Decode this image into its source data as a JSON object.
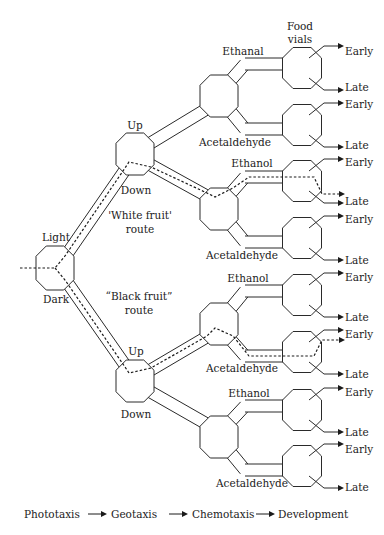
{
  "diagram": {
    "colors": {
      "stroke": "#2a2a2a",
      "text": "#222222",
      "background": "#ffffff"
    },
    "phototaxis": {
      "chamber_center": [
        55,
        268
      ],
      "labels": {
        "light": "Light",
        "dark": "Dark"
      }
    },
    "routes": {
      "white": {
        "line1": "'White fruit'",
        "line2": "route"
      },
      "black": {
        "line1": "“Black fruit”",
        "line2": "route"
      }
    },
    "geotaxis": [
      {
        "id": "geo-upper",
        "center": [
          135,
          154
        ],
        "up": "Up",
        "down": "Down"
      },
      {
        "id": "geo-lower",
        "center": [
          135,
          381
        ],
        "up": "Up",
        "down": "Down"
      }
    ],
    "chemotaxis": [
      {
        "id": "chem-1",
        "center": [
          219,
          96
        ],
        "top_label": "Ethanal",
        "bottom_label": "Acetaldehyde"
      },
      {
        "id": "chem-2",
        "center": [
          219,
          209
        ],
        "top_label": "Ethanol",
        "bottom_label": "Acetaldehyde"
      },
      {
        "id": "chem-3",
        "center": [
          219,
          324
        ],
        "top_label": "Ethanol",
        "bottom_label": "Acetaldehyde"
      },
      {
        "id": "chem-4",
        "center": [
          219,
          437
        ],
        "top_label": "Ethanol",
        "bottom_label": "Acetaldehyde"
      }
    ],
    "food_vials_header": {
      "line1": "Food",
      "line2": "vials"
    },
    "vials": [
      {
        "center": [
          302,
          68
        ],
        "early": "Early",
        "late": "Late"
      },
      {
        "center": [
          302,
          125
        ],
        "early": "Early",
        "late": "Late"
      },
      {
        "center": [
          302,
          181
        ],
        "early": "Early",
        "late": "Late"
      },
      {
        "center": [
          302,
          238
        ],
        "early": "Early",
        "late": "Late"
      },
      {
        "center": [
          302,
          295
        ],
        "early": "Early",
        "late": "Late"
      },
      {
        "center": [
          302,
          352
        ],
        "early": "Early",
        "late": "Late"
      },
      {
        "center": [
          302,
          410
        ],
        "early": "Early",
        "late": "Late"
      },
      {
        "center": [
          302,
          466
        ],
        "early": "Early",
        "late": "Late"
      }
    ],
    "legend": {
      "steps": [
        "Phototaxis",
        "Geotaxis",
        "Chemotaxis",
        "Development"
      ]
    }
  }
}
